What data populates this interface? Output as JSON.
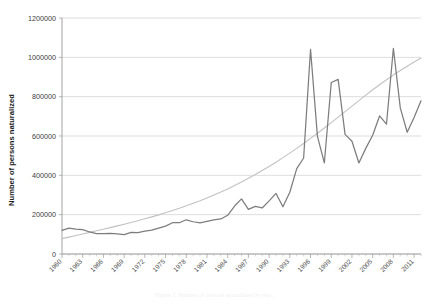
{
  "chart_data": {
    "type": "line",
    "title": "",
    "xlabel": "",
    "ylabel": "Number of persons naturalized",
    "ylim": [
      0,
      1200000
    ],
    "ytick_step": 200000,
    "yticks": [
      "0",
      "200000",
      "400000",
      "600000",
      "800000",
      "1000000",
      "1200000"
    ],
    "grid": true,
    "legend": "none",
    "xlim": [
      1960,
      2012
    ],
    "xtick_labels": [
      "1960",
      "1963",
      "1966",
      "1969",
      "1972",
      "1975",
      "1978",
      "1981",
      "1984",
      "1987",
      "1990",
      "1993",
      "1996",
      "1999",
      "2002",
      "2005",
      "2008",
      "2011"
    ],
    "xtick_step": 3,
    "x": [
      1960,
      1961,
      1962,
      1963,
      1964,
      1965,
      1966,
      1967,
      1968,
      1969,
      1970,
      1971,
      1972,
      1973,
      1974,
      1975,
      1976,
      1977,
      1978,
      1979,
      1980,
      1981,
      1982,
      1983,
      1984,
      1985,
      1986,
      1987,
      1988,
      1989,
      1990,
      1991,
      1992,
      1993,
      1994,
      1995,
      1996,
      1997,
      1998,
      1999,
      2000,
      2001,
      2002,
      2003,
      2004,
      2005,
      2006,
      2007,
      2008,
      2009,
      2010,
      2011,
      2012
    ],
    "series": [
      {
        "name": "Persons naturalized",
        "color": "#7d7d7d",
        "style": "solid",
        "values": [
          120000,
          132000,
          127000,
          124000,
          112000,
          104000,
          103000,
          105000,
          102000,
          99000,
          110000,
          109000,
          116000,
          121000,
          132000,
          142000,
          159000,
          159000,
          174000,
          164000,
          158000,
          166000,
          174000,
          178000,
          197000,
          244000,
          280000,
          227000,
          242000,
          234000,
          270000,
          308000,
          240000,
          314000,
          434000,
          488000,
          1041000,
          598000,
          463000,
          872000,
          888000,
          608000,
          573000,
          463000,
          537000,
          604000,
          702000,
          660000,
          1046000,
          743000,
          619000,
          694000,
          779000
        ]
      },
      {
        "name": "Trend (polynomial)",
        "color": "#c2c2c2",
        "style": "solid",
        "values": [
          78000,
          86000,
          94000,
          102000,
          110000,
          118000,
          126000,
          134000,
          143000,
          151000,
          160000,
          169000,
          179000,
          189000,
          199000,
          210000,
          221000,
          233000,
          245000,
          258000,
          271000,
          285000,
          300000,
          315000,
          331000,
          348000,
          366000,
          385000,
          404000,
          424000,
          445000,
          467000,
          490000,
          513000,
          537000,
          562000,
          588000,
          614000,
          641000,
          668000,
          696000,
          724000,
          752000,
          780000,
          808000,
          835000,
          861000,
          886000,
          910000,
          933000,
          955000,
          976000,
          996000
        ]
      }
    ]
  },
  "bleed_text": {
    "line": "Figure 1. Number of persons naturalized by year."
  }
}
